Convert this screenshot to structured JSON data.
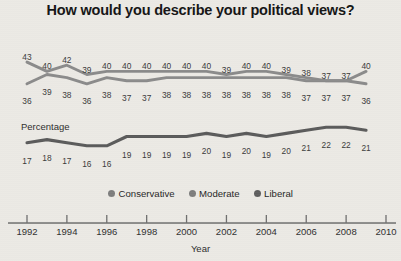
{
  "title": "How would you describe your political views?",
  "axes": {
    "xlabel": "Year",
    "ylabel": "Percentage",
    "xticks": [
      "1992",
      "1994",
      "1996",
      "1998",
      "2000",
      "2002",
      "2004",
      "2006",
      "2008",
      "2010"
    ]
  },
  "legend": [
    {
      "label": "Conservative",
      "color": "#7d7d7d"
    },
    {
      "label": "Moderate",
      "color": "#7d7d7d"
    },
    {
      "label": "Liberal",
      "color": "#5e5e5e"
    }
  ],
  "colors": {
    "background": "#ebe9e4",
    "line_moderate": "#8a8a8a",
    "line_conservative": "#8a8a8a",
    "line_liberal": "#5a5a5a",
    "axis": "#6e6e6e",
    "text": "#2b2b2b"
  },
  "chart_data": {
    "type": "line",
    "title": "How would you describe your political views?",
    "xlabel": "Year",
    "ylabel": "Percentage",
    "grid": false,
    "legend_position": "bottom",
    "x": [
      1992,
      1993,
      1994,
      1995,
      1996,
      1997,
      1998,
      1999,
      2000,
      2001,
      2002,
      2003,
      2004,
      2005,
      2006,
      2007,
      2008,
      2009
    ],
    "xlim": [
      1992,
      2010
    ],
    "ylim": [
      14,
      44
    ],
    "series": [
      {
        "name": "Moderate",
        "values": [
          43,
          40,
          42,
          39,
          40,
          40,
          40,
          40,
          40,
          40,
          39,
          40,
          40,
          39,
          38,
          37,
          37,
          40
        ]
      },
      {
        "name": "Conservative",
        "values": [
          36,
          39,
          38,
          36,
          38,
          37,
          37,
          38,
          38,
          38,
          38,
          38,
          38,
          38,
          37,
          37,
          37,
          36
        ]
      },
      {
        "name": "Liberal",
        "values": [
          17,
          18,
          17,
          16,
          16,
          19,
          19,
          19,
          19,
          20,
          19,
          20,
          19,
          20,
          21,
          22,
          22,
          21
        ]
      }
    ]
  }
}
